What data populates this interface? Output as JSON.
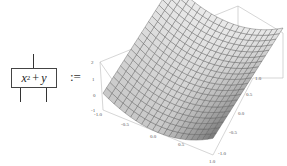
{
  "diagram": {
    "box": {
      "expression_base": "x",
      "expression_exp": "2",
      "expression_op": "+",
      "expression_var": "y",
      "inputs": 2,
      "outputs": 1
    },
    "definition_symbol": ":=",
    "plot": {
      "type": "surface3d",
      "function": "x^2 + y",
      "x_ticks": [
        "-1.0",
        "-0.5",
        "0.0",
        "0.5",
        "1.0"
      ],
      "y_ticks": [
        "-1.0",
        "-0.5",
        "0.0",
        "0.5",
        "1.0"
      ],
      "z_ticks": [
        "2",
        "1",
        "0",
        "-1"
      ],
      "x_range": [
        -1,
        1
      ],
      "y_range": [
        -1,
        1
      ],
      "z_range": [
        -1,
        2
      ],
      "mesh_color": "#555555",
      "surface_color": "#cfcfcf",
      "box_color": "#bbbbbb"
    }
  }
}
